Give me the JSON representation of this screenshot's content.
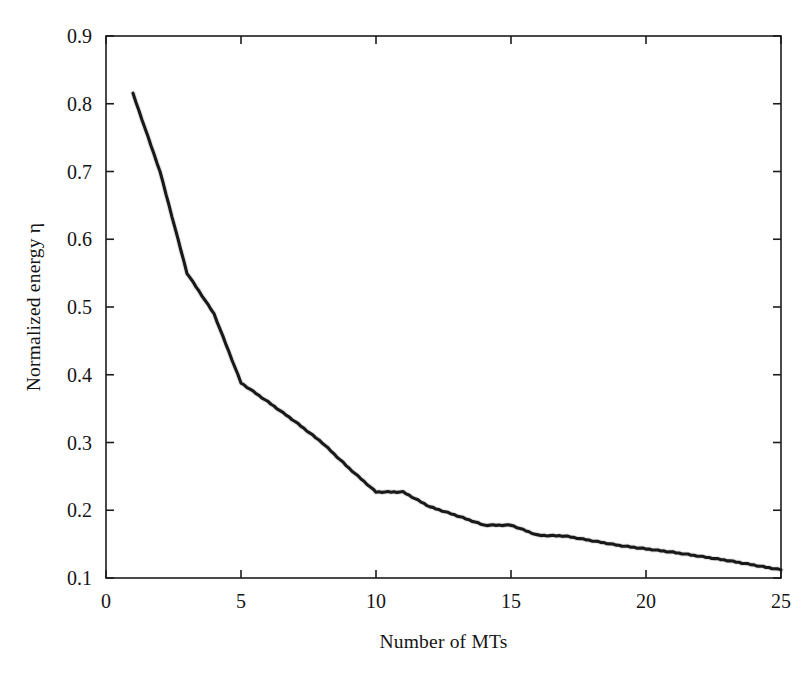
{
  "chart_data": {
    "type": "line",
    "title": "",
    "xlabel": "Number of MTs",
    "ylabel": "Normalized energy η",
    "xlim": [
      0,
      25
    ],
    "ylim": [
      0.1,
      0.9
    ],
    "xticks": [
      0,
      5,
      10,
      15,
      20,
      25
    ],
    "xtick_labels": [
      "0",
      "5",
      "10",
      "15",
      "20",
      "25"
    ],
    "yticks": [
      0.1,
      0.2,
      0.3,
      0.4,
      0.5,
      0.6,
      0.7,
      0.8,
      0.9
    ],
    "ytick_labels": [
      "0.1",
      "0.2",
      "0.3",
      "0.4",
      "0.5",
      "0.6",
      "0.7",
      "0.8",
      "0.9"
    ],
    "grid": true,
    "legend": false,
    "legend_position": "none",
    "line_color": "#191919",
    "background_color": "#ffffff",
    "grid_color": "#8d8d8d",
    "series": [
      {
        "name": "Normalized energy",
        "x": [
          1,
          2,
          3,
          4,
          5,
          6,
          7,
          8,
          9,
          10,
          11,
          12,
          13,
          14,
          15,
          16,
          17,
          18,
          19,
          20,
          21,
          22,
          23,
          24,
          25
        ],
        "values": [
          0.815,
          0.7,
          0.55,
          0.49,
          0.388,
          0.36,
          0.331,
          0.3,
          0.262,
          0.227,
          0.227,
          0.205,
          0.192,
          0.178,
          0.178,
          0.163,
          0.162,
          0.155,
          0.148,
          0.143,
          0.138,
          0.132,
          0.126,
          0.119,
          0.112
        ]
      }
    ]
  },
  "axes": {
    "x_label": "Number of MTs",
    "y_label": "Normalized energy η"
  }
}
